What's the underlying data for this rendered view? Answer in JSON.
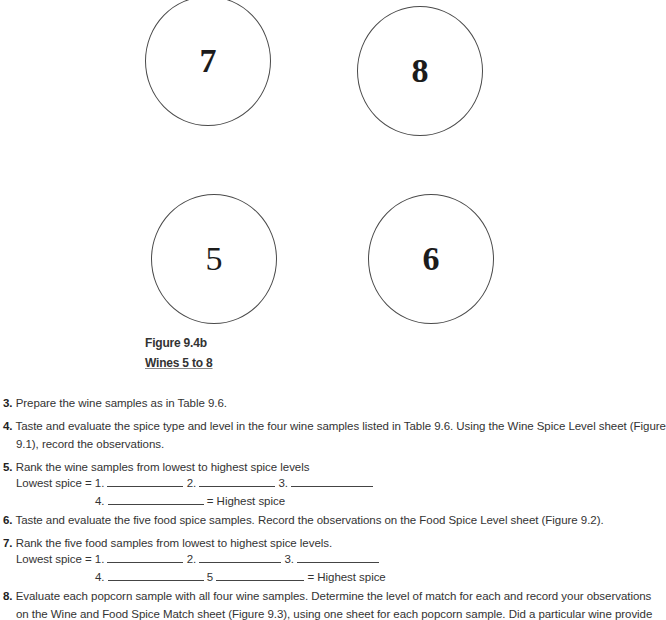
{
  "figure": {
    "circles": [
      {
        "label": "7",
        "bold": true
      },
      {
        "label": "8",
        "bold": true
      },
      {
        "label": "5",
        "bold": false
      },
      {
        "label": "6",
        "bold": true
      }
    ],
    "caption_title": "Figure 9.4b",
    "caption_subtitle": "Wines 5 to 8"
  },
  "steps": {
    "s3": {
      "num": "3.",
      "text": "Prepare the wine samples as in Table 9.6."
    },
    "s4": {
      "num": "4.",
      "line1": "Taste and evaluate the spice type and level in the four wine samples listed in Table 9.6. Using the Wine Spice Level sheet (Figure",
      "line2": "9.1), record the observations."
    },
    "s5": {
      "num": "5.",
      "text": "Rank the wine samples from lowest to highest spice levels",
      "lowest": "Lowest spice = 1.",
      "r2": "2.",
      "r3": "3.",
      "r4": "4.",
      "highest": "= Highest spice"
    },
    "s6": {
      "num": "6.",
      "text": "Taste and evaluate the five food spice samples. Record the observations on the Food Spice Level sheet (Figure 9.2)."
    },
    "s7": {
      "num": "7.",
      "text": "Rank the five food samples from lowest to highest spice levels.",
      "lowest": "Lowest spice = 1.",
      "r2": "2.",
      "r3": "3.",
      "r4": "4.",
      "r5": "5",
      "highest": "= Highest spice"
    },
    "s8": {
      "num": "8.",
      "line1": "Evaluate each popcorn sample with all four wine samples. Determine the level of match for each and record your observations",
      "line2": "on the Wine and Food Spice Match sheet (Figure 9.3), using one sheet for each popcorn sample. Did a particular wine provide"
    }
  }
}
